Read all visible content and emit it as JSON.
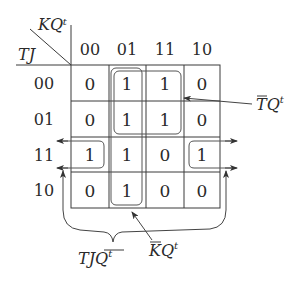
{
  "kmap": {
    "corner": {
      "top_var": "KQᵗ",
      "left_var": "TJ"
    },
    "columns": [
      "00",
      "01",
      "11",
      "10"
    ],
    "rows": [
      "00",
      "01",
      "11",
      "10"
    ],
    "cells": [
      [
        "0",
        "1",
        "1",
        "0"
      ],
      [
        "0",
        "1",
        "1",
        "0"
      ],
      [
        "1",
        "1",
        "0",
        "1"
      ],
      [
        "0",
        "1",
        "0",
        "0"
      ]
    ]
  },
  "groups": [
    {
      "id": "tbar-q",
      "label_main": "TQ",
      "label_bar": "T",
      "label_sup": "t",
      "covers": "rows 00-01, columns 01-11"
    },
    {
      "id": "kbar-q",
      "label_main": "KQ",
      "label_bar": "K",
      "label_sup": "t",
      "covers": "column 01, all rows"
    },
    {
      "id": "tj-qbar",
      "label_main": "TJQ",
      "label_bar": "Q",
      "label_sup": "t",
      "covers": "row 11, columns 00 and 10 (wrap-around)"
    }
  ],
  "colors": {
    "ink": "#2a2a2a",
    "grid": "#3a3a3a",
    "background": "#ffffff"
  }
}
